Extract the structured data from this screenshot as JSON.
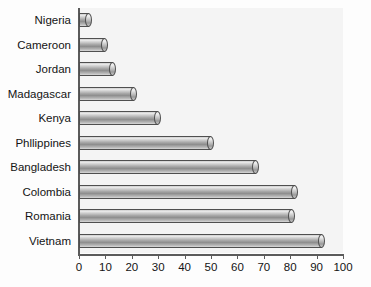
{
  "chart_data": {
    "type": "bar",
    "orientation": "horizontal",
    "title": "",
    "xlabel": "",
    "ylabel": "",
    "xlim": [
      0,
      100
    ],
    "xticks": [
      0,
      10,
      20,
      30,
      40,
      50,
      60,
      70,
      80,
      90,
      100
    ],
    "grid": false,
    "legend": false,
    "categories": [
      "Nigeria",
      "Cameroon",
      "Jordan",
      "Madagascar",
      "Kenya",
      "Phllippines",
      "Bangladesh",
      "Colombia",
      "Romania",
      "Vietnam"
    ],
    "values": [
      5,
      11,
      14,
      22,
      31,
      51,
      68,
      83,
      82,
      93
    ],
    "bar_style": "3d-cylinder",
    "colors": {
      "bar_light": "#e8e8e8",
      "bar_mid": "#a7a7a7",
      "bar_dark": "#8e8e8e",
      "bar_outline": "#4f4f4f",
      "plot_background": "#f4f4f4",
      "axis": "#5b5b5b",
      "text": "#141414",
      "page_background": "#fdfdfd"
    }
  }
}
